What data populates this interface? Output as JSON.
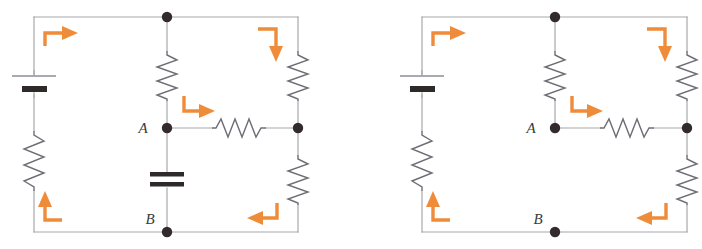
{
  "figure": {
    "kind": "circuit-diagram",
    "panel_count": 2,
    "background_color": "#ffffff",
    "wire_color": "#a8a8ae",
    "node_color": "#332b2b",
    "component_color": "#6d6d75",
    "battery_bar_color": "#2e2a2a",
    "arrow_color": "#ef8c3a",
    "label_color": "#3a3a3a"
  },
  "panels": [
    {
      "id": "left-circuit",
      "name": "circuit-with-capacitor",
      "labels": {
        "node_a": "A",
        "node_b": "B"
      },
      "components": [
        {
          "name": "battery",
          "orientation": "vertical",
          "side": "left"
        },
        {
          "name": "resistor-left-lower",
          "orientation": "vertical",
          "side": "left"
        },
        {
          "name": "resistor-middle-upper",
          "orientation": "vertical",
          "side": "middle"
        },
        {
          "name": "capacitor",
          "orientation": "vertical",
          "side": "middle"
        },
        {
          "name": "resistor-horizontal",
          "orientation": "horizontal",
          "side": "middle-right"
        },
        {
          "name": "resistor-right-upper",
          "orientation": "vertical",
          "side": "right"
        },
        {
          "name": "resistor-right-lower",
          "orientation": "vertical",
          "side": "right"
        }
      ],
      "current_arrows": [
        {
          "name": "arrow-top-left",
          "direction": "right",
          "turn": "up-then-right"
        },
        {
          "name": "arrow-top-right",
          "direction": "down",
          "turn": "right-then-down"
        },
        {
          "name": "arrow-middle",
          "direction": "right",
          "turn": "down-then-right"
        },
        {
          "name": "arrow-bottom-left",
          "direction": "up",
          "turn": "left-then-up"
        },
        {
          "name": "arrow-bottom-right",
          "direction": "left",
          "turn": "down-then-left"
        }
      ],
      "nodes": [
        {
          "name": "node-top-middle"
        },
        {
          "name": "node-a"
        },
        {
          "name": "node-right-middle"
        },
        {
          "name": "node-b"
        }
      ]
    },
    {
      "id": "right-circuit",
      "name": "circuit-without-capacitor",
      "labels": {
        "node_a": "A",
        "node_b": "B"
      },
      "components": [
        {
          "name": "battery",
          "orientation": "vertical",
          "side": "left"
        },
        {
          "name": "resistor-left-lower",
          "orientation": "vertical",
          "side": "left"
        },
        {
          "name": "resistor-middle-upper",
          "orientation": "vertical",
          "side": "middle"
        },
        {
          "name": "resistor-horizontal",
          "orientation": "horizontal",
          "side": "middle-right"
        },
        {
          "name": "resistor-right-upper",
          "orientation": "vertical",
          "side": "right"
        },
        {
          "name": "resistor-right-lower",
          "orientation": "vertical",
          "side": "right"
        }
      ],
      "current_arrows": [
        {
          "name": "arrow-top-left",
          "direction": "right",
          "turn": "up-then-right"
        },
        {
          "name": "arrow-top-right",
          "direction": "down",
          "turn": "right-then-down"
        },
        {
          "name": "arrow-middle",
          "direction": "right",
          "turn": "down-then-right"
        },
        {
          "name": "arrow-bottom-left",
          "direction": "up",
          "turn": "left-then-up"
        },
        {
          "name": "arrow-bottom-right",
          "direction": "left",
          "turn": "down-then-left"
        }
      ],
      "nodes": [
        {
          "name": "node-top-middle"
        },
        {
          "name": "node-a"
        },
        {
          "name": "node-right-middle"
        },
        {
          "name": "node-b"
        }
      ]
    }
  ]
}
